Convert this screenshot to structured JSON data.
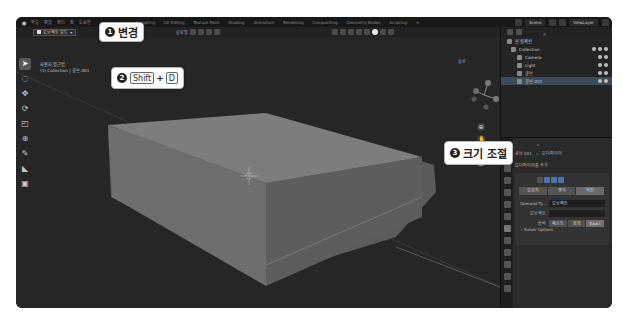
{
  "menubar": {
    "items": [
      "파일",
      "편집",
      "렌더",
      "창",
      "도움말"
    ],
    "workspaces": [
      "Sculpting",
      "UV Editing",
      "Texture Paint",
      "Shading",
      "Animation",
      "Rendering",
      "Compositing",
      "Geometry Nodes",
      "Scripting",
      "+"
    ],
    "scene": "Scene",
    "view_layer": "ViewLayer"
  },
  "header": {
    "mode": "오브젝트 모드",
    "transform_orientation": "글로벌",
    "options": "옵션"
  },
  "viewport": {
    "view_name": "사용자 원근법",
    "collection_info": "(1) Collection | 큐브.001",
    "status_text": "크기 조정"
  },
  "outliner": {
    "root": "씬 컬렉션",
    "items": [
      {
        "name": "Collection",
        "selected": false
      },
      {
        "name": "Camera",
        "selected": false
      },
      {
        "name": "Light",
        "selected": false
      },
      {
        "name": "큐브",
        "selected": false
      },
      {
        "name": "큐브.001",
        "selected": true
      }
    ]
  },
  "properties": {
    "object_name": "큐브.001",
    "modifier_tab": "모디파이어",
    "add_modifier": "모디파이어를 추가",
    "segmented": [
      "오리지",
      "엣지",
      "직선"
    ],
    "operand_label": "Operand Ty...",
    "operand_value": "오브젝트",
    "object_label": "오브젝트",
    "solver_label": "솔버",
    "solver_options": [
      "패스트",
      "정확",
      "Exact"
    ],
    "solver_options_label": "Solver Options"
  },
  "callouts": {
    "step1": {
      "number": "1",
      "text": "변경"
    },
    "step2": {
      "number": "2",
      "key1": "Shift",
      "plus": "+",
      "key2": "D"
    },
    "step3": {
      "number": "3",
      "text": "크기 조절"
    }
  }
}
